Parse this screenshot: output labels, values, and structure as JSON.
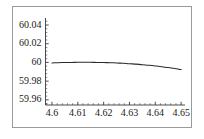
{
  "chart_data": {
    "type": "line",
    "title": "",
    "subtitle": "",
    "xlabel": "",
    "ylabel": "",
    "xlim": [
      4.5975,
      4.6515
    ],
    "ylim": [
      59.9545,
      60.0475
    ],
    "xticks": [
      4.6,
      4.61,
      4.62,
      4.63,
      4.64,
      4.65
    ],
    "xtick_labels": [
      "4.6",
      "4.61",
      "4.62",
      "4.63",
      "4.64",
      "4.65"
    ],
    "yticks": [
      59.96,
      59.98,
      60.0,
      60.02,
      60.04
    ],
    "ytick_labels": [
      "59.96",
      "59.98",
      "60",
      "60.02",
      "60.04"
    ],
    "x_minor_count": 4,
    "y_minor_count": 4,
    "grid": false,
    "legend": null,
    "line_color": "#2b2b2b",
    "frame_color": "#9a9a9a",
    "axis_color": "#3a3a3a",
    "background": "#ffffff",
    "series": [
      {
        "name": "curve",
        "x": [
          4.6,
          4.6025,
          4.605,
          4.6075,
          4.61,
          4.6125,
          4.615,
          4.6175,
          4.62,
          4.6225,
          4.625,
          4.6275,
          4.63,
          4.6325,
          4.635,
          4.6375,
          4.64,
          4.6425,
          4.645,
          4.6475,
          4.65
        ],
        "values": [
          59.9995,
          59.99975,
          59.99993,
          60.00004,
          60.0001,
          60.00012,
          60.0001,
          60.00003,
          59.9999,
          59.9997,
          59.99944,
          59.9991,
          59.99869,
          59.9982,
          59.99763,
          59.99698,
          59.99624,
          59.99541,
          59.99449,
          59.99347,
          59.99235
        ]
      }
    ]
  },
  "axes": {
    "y_tick_labels": [
      "60.04",
      "60.02",
      "60",
      "59.98",
      "59.96"
    ],
    "x_tick_labels": [
      "4.6",
      "4.61",
      "4.62",
      "4.63",
      "4.64",
      "4.65"
    ]
  }
}
